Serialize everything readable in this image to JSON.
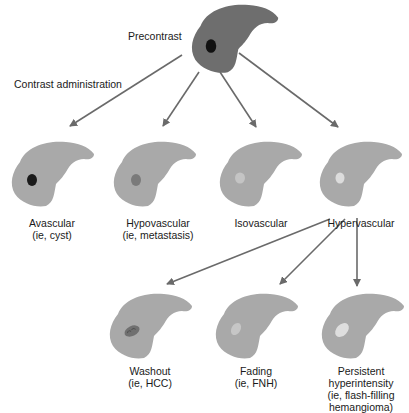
{
  "colors": {
    "precontrast_liver": "#6e6e6e",
    "enhanced_liver": "#a9a9a9",
    "arrow": "#6a6a6a",
    "text": "#1a1a1a"
  },
  "labels": {
    "precontrast": "Precontrast",
    "contrast_administration": "Contrast administration"
  },
  "first_level": [
    {
      "name": "Avascular",
      "example": "(ie, cyst)",
      "lesion_color": "#1a1a1a"
    },
    {
      "name": "Hypovascular",
      "example": "(ie, metastasis)",
      "lesion_color": "#7a7a7a"
    },
    {
      "name": "Isovascular",
      "example": "",
      "lesion_color": "#c4c4c4"
    },
    {
      "name": "Hypervascular",
      "example": "",
      "lesion_color": "#dcdcdc"
    }
  ],
  "second_level": [
    {
      "name": "Washout",
      "example": "(ie, HCC)",
      "lesion_color": "#707070"
    },
    {
      "name": "Fading",
      "example": "(ie, FNH)",
      "lesion_color": "#c6c6c6"
    },
    {
      "name": "Persistent",
      "line2": "hyperintensity",
      "line3": "(ie, flash-filling",
      "line4": "hemangioma)",
      "lesion_color": "#dedede"
    }
  ]
}
